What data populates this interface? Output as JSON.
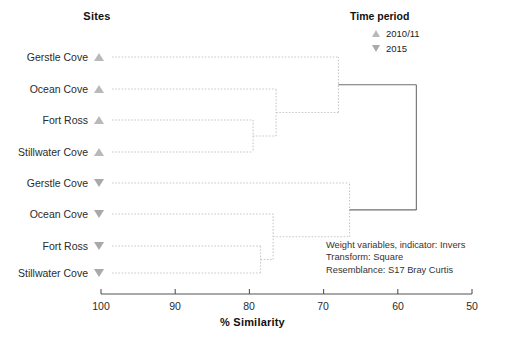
{
  "headers": {
    "sites": "Sites",
    "legend_title": "Time period"
  },
  "legend": {
    "items": [
      {
        "marker": "triangle-up-icon",
        "label": "2010/11"
      },
      {
        "marker": "triangle-down-icon",
        "label": "2015"
      }
    ]
  },
  "axis": {
    "title": "% Similarity",
    "ticks": [
      "100",
      "90",
      "80",
      "70",
      "60",
      "50"
    ],
    "min": 50,
    "max": 100,
    "reversed": true
  },
  "annotation": {
    "lines": [
      "Weight variables, indicator: Invers",
      "Transform: Square",
      "Resemblance: S17 Bray Curtis"
    ]
  },
  "leaves": [
    {
      "site": "Gerstle Cove",
      "period": "2010/11",
      "marker": "triangle-up-icon"
    },
    {
      "site": "Ocean Cove",
      "period": "2010/11",
      "marker": "triangle-up-icon"
    },
    {
      "site": "Fort Ross",
      "period": "2010/11",
      "marker": "triangle-up-icon"
    },
    {
      "site": "Stillwater Cove",
      "period": "2010/11",
      "marker": "triangle-up-icon"
    },
    {
      "site": "Gerstle Cove",
      "period": "2015",
      "marker": "triangle-down-icon"
    },
    {
      "site": "Ocean Cove",
      "period": "2015",
      "marker": "triangle-down-icon"
    },
    {
      "site": "Fort Ross",
      "period": "2015",
      "marker": "triangle-down-icon"
    },
    {
      "site": "Stillwater Cove",
      "period": "2015",
      "marker": "triangle-down-icon"
    }
  ],
  "colors": {
    "marker_up": "#b9b9b9",
    "marker_down": "#a9a9a9",
    "branch": "#c9c9c9",
    "root_branch": "#6e6e6e",
    "axis": "#555555",
    "text": "#2b2b2b"
  },
  "chart_data": {
    "type": "dendrogram",
    "title": "",
    "xlabel": "% Similarity",
    "ylabel": "Sites",
    "xlim": [
      100,
      50
    ],
    "x_reversed": true,
    "xticks": [
      100,
      90,
      80,
      70,
      60,
      50
    ],
    "grid": false,
    "legend_position": "top-right",
    "legend_entries": [
      "2010/11",
      "2015"
    ],
    "leaf_order": [
      "Gerstle Cove 2010/11",
      "Ocean Cove 2010/11",
      "Fort Ross 2010/11",
      "Stillwater Cove 2010/11",
      "Gerstle Cove 2015",
      "Ocean Cove 2015",
      "Fort Ross 2015",
      "Stillwater Cove 2015"
    ],
    "merges": [
      {
        "id": "m1",
        "children": [
          "Fort Ross 2010/11",
          "Stillwater Cove 2010/11"
        ],
        "similarity": 79.5
      },
      {
        "id": "m2",
        "children": [
          "m1",
          "Ocean Cove 2010/11"
        ],
        "similarity": 76.4
      },
      {
        "id": "m3",
        "children": [
          "m2",
          "Gerstle Cove 2010/11"
        ],
        "similarity": 68.0
      },
      {
        "id": "m4",
        "children": [
          "Fort Ross 2015",
          "Stillwater Cove 2015"
        ],
        "similarity": 78.5
      },
      {
        "id": "m5",
        "children": [
          "m4",
          "Ocean Cove 2015"
        ],
        "similarity": 76.8
      },
      {
        "id": "m6",
        "children": [
          "m5",
          "Gerstle Cove 2015"
        ],
        "similarity": 66.5
      },
      {
        "id": "root",
        "children": [
          "m3",
          "m6"
        ],
        "similarity": 57.5
      }
    ]
  }
}
